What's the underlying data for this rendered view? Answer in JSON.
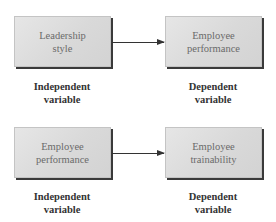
{
  "diagram": {
    "rows": [
      {
        "independent_box": {
          "line1": "Leadership",
          "line2": "style"
        },
        "dependent_box": {
          "line1": "Employee",
          "line2": "performance"
        },
        "independent_label": {
          "line1": "Independent",
          "line2": "variable"
        },
        "dependent_label": {
          "line1": "Dependent",
          "line2": "variable"
        }
      },
      {
        "independent_box": {
          "line1": "Employee",
          "line2": "performance"
        },
        "dependent_box": {
          "line1": "Employee",
          "line2": "trainability"
        },
        "independent_label": {
          "line1": "Independent",
          "line2": "variable"
        },
        "dependent_label": {
          "line1": "Dependent",
          "line2": "variable"
        }
      }
    ],
    "colors": {
      "box_fill": "#dcdcdc",
      "box_text": "#6a6a6a",
      "box_shadow": "#3a3a3a",
      "arrow": "#333333",
      "label_text": "#333333"
    }
  }
}
